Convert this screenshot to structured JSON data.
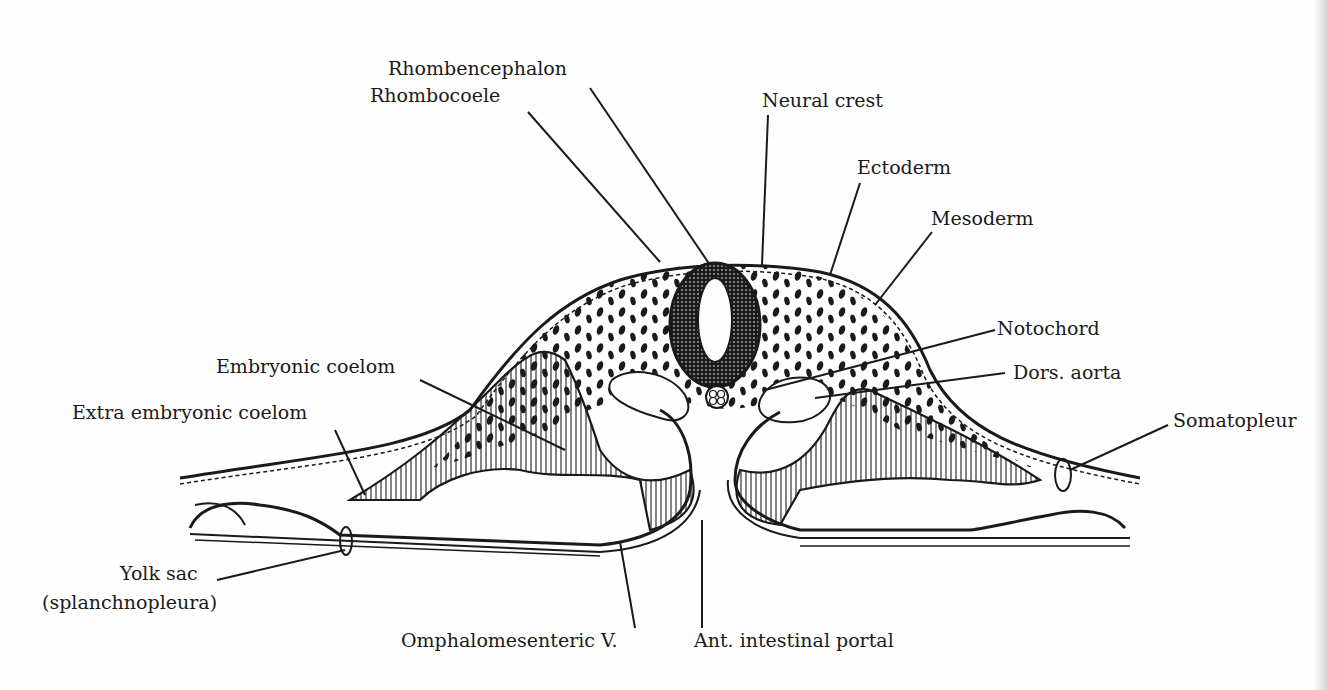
{
  "diagram": {
    "type": "anatomical-cross-section",
    "labels": {
      "rhombencephalon": "Rhombencephalon",
      "rhombocoele": "Rhombocoele",
      "neural_crest": "Neural crest",
      "ectoderm": "Ectoderm",
      "mesoderm": "Mesoderm",
      "notochord": "Notochord",
      "dors_aorta": "Dors. aorta",
      "somatopleure": "Somatopleur",
      "embryonic_coelom": "Embryonic coelom",
      "extra_embryonic_coelom": "Extra embryonic coelom",
      "yolk_sac": "Yolk sac",
      "yolk_sac_sub": "(splanchnopleura)",
      "omphalomesenteric_v": "Omphalomesenteric V.",
      "ant_intestinal_portal": "Ant. intestinal portal"
    },
    "colors": {
      "ink": "#1a1a1a",
      "paper": "#fefefe"
    }
  }
}
